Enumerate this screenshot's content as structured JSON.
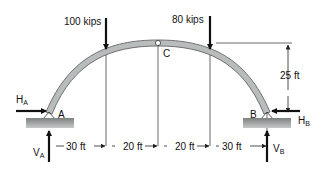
{
  "diagram": {
    "type": "three-hinged arch",
    "loads": [
      {
        "label": "100 kips",
        "direction": "down"
      },
      {
        "label": "80 kips",
        "direction": "down"
      }
    ],
    "hinge_crown": "C",
    "supports": [
      {
        "label": "A",
        "reactions": {
          "horizontal": {
            "main": "H",
            "sub": "A"
          },
          "vertical": {
            "main": "V",
            "sub": "A"
          }
        }
      },
      {
        "label": "B",
        "reactions": {
          "horizontal": {
            "main": "H",
            "sub": "B"
          },
          "vertical": {
            "main": "V",
            "sub": "B"
          }
        }
      }
    ],
    "rise": "25 ft",
    "spans": [
      "30 ft",
      "20 ft",
      "20 ft",
      "30 ft"
    ],
    "colors": {
      "arch_fill": "#b9bcbc",
      "arch_stroke": "#555555",
      "ground": "#8f9292",
      "arrow": "#111111"
    }
  }
}
